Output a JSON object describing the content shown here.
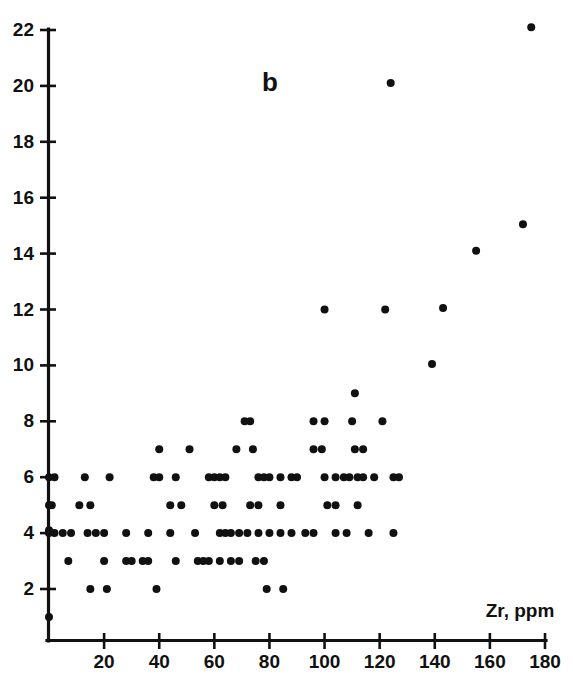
{
  "figure": {
    "panel_label": "b",
    "background_color": "#ffffff",
    "ink_color": "#111111"
  },
  "chart_data": {
    "type": "scatter",
    "title": "b",
    "xlabel": "Zr, ppm",
    "ylabel": "",
    "xlim": [
      0,
      180
    ],
    "ylim": [
      0,
      22.6
    ],
    "xticks": [
      20,
      40,
      60,
      80,
      100,
      120,
      140,
      160,
      180
    ],
    "xticklabels": [
      "20",
      "40",
      "60",
      "80",
      "100",
      "120",
      "140",
      "160",
      "180"
    ],
    "yticks": [
      2,
      4,
      6,
      8,
      10,
      12,
      14,
      16,
      18,
      20,
      22
    ],
    "yticklabels": [
      "2",
      "4",
      "6",
      "8",
      "10",
      "12",
      "14",
      "16",
      "18",
      "20",
      "22"
    ],
    "grid": false,
    "legend": null,
    "marker": "circle",
    "marker_color": "#111111",
    "marker_size": 4.0,
    "points": [
      [
        0,
        1
      ],
      [
        0,
        4
      ],
      [
        0,
        4.1
      ],
      [
        2,
        4
      ],
      [
        5,
        4
      ],
      [
        8,
        4
      ],
      [
        14,
        4
      ],
      [
        17,
        4
      ],
      [
        20,
        4
      ],
      [
        0,
        5
      ],
      [
        1,
        5
      ],
      [
        11,
        5
      ],
      [
        15,
        5
      ],
      [
        0,
        6
      ],
      [
        2,
        6
      ],
      [
        13,
        6
      ],
      [
        22,
        6
      ],
      [
        7,
        3
      ],
      [
        20,
        3
      ],
      [
        28,
        3
      ],
      [
        15,
        2
      ],
      [
        21,
        2
      ],
      [
        28,
        4
      ],
      [
        36,
        4
      ],
      [
        44,
        4
      ],
      [
        53,
        4
      ],
      [
        30,
        3
      ],
      [
        34,
        3
      ],
      [
        36,
        3
      ],
      [
        39,
        2
      ],
      [
        40,
        7
      ],
      [
        51,
        7
      ],
      [
        38,
        6
      ],
      [
        40,
        6
      ],
      [
        46,
        6
      ],
      [
        44,
        5
      ],
      [
        48,
        5
      ],
      [
        46,
        3
      ],
      [
        54,
        3
      ],
      [
        56,
        3
      ],
      [
        58,
        3
      ],
      [
        60,
        5
      ],
      [
        63,
        5
      ],
      [
        58,
        6
      ],
      [
        60,
        6
      ],
      [
        62,
        6
      ],
      [
        64,
        6
      ],
      [
        62,
        4
      ],
      [
        64,
        4
      ],
      [
        66,
        4
      ],
      [
        69,
        4
      ],
      [
        72,
        4
      ],
      [
        76,
        4
      ],
      [
        62,
        3
      ],
      [
        66,
        3
      ],
      [
        69,
        3
      ],
      [
        68,
        7
      ],
      [
        74,
        7
      ],
      [
        71,
        8
      ],
      [
        73,
        8
      ],
      [
        76,
        6
      ],
      [
        78,
        6
      ],
      [
        80,
        6
      ],
      [
        73,
        5
      ],
      [
        76,
        5
      ],
      [
        75,
        3
      ],
      [
        78,
        3
      ],
      [
        79,
        2
      ],
      [
        85,
        2
      ],
      [
        80,
        4
      ],
      [
        84,
        4
      ],
      [
        84,
        6
      ],
      [
        88,
        6
      ],
      [
        90,
        6
      ],
      [
        84,
        5
      ],
      [
        88,
        4
      ],
      [
        93,
        4
      ],
      [
        96,
        4
      ],
      [
        96,
        7
      ],
      [
        99,
        7
      ],
      [
        96,
        8
      ],
      [
        100,
        8
      ],
      [
        100,
        12
      ],
      [
        100,
        6
      ],
      [
        104,
        6
      ],
      [
        107,
        6
      ],
      [
        109,
        6
      ],
      [
        101,
        5
      ],
      [
        104,
        5
      ],
      [
        104,
        4
      ],
      [
        108,
        4
      ],
      [
        111,
        9
      ],
      [
        111,
        7
      ],
      [
        114,
        7
      ],
      [
        110,
        8
      ],
      [
        112,
        6
      ],
      [
        114,
        6
      ],
      [
        112,
        5
      ],
      [
        116,
        4
      ],
      [
        118,
        6
      ],
      [
        121,
        8
      ],
      [
        122,
        12
      ],
      [
        124,
        20.1
      ],
      [
        125,
        6
      ],
      [
        127,
        6
      ],
      [
        125,
        4
      ],
      [
        139,
        10.05
      ],
      [
        143,
        12.05
      ],
      [
        155,
        14.1
      ],
      [
        172,
        15.05
      ],
      [
        175,
        22.1
      ]
    ]
  },
  "axes": {
    "x_axis_label": "Zr, ppm",
    "y_axis_label": ""
  }
}
